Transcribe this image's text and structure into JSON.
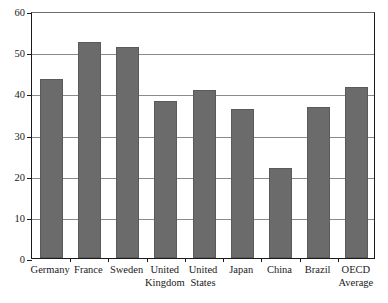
{
  "chart_data": {
    "type": "bar",
    "title": "",
    "subtitle": "",
    "xlabel": "",
    "ylabel": "",
    "categories": [
      "Germany",
      "France",
      "Sweden",
      "United Kingdom",
      "United States",
      "Japan",
      "China",
      "Brazil",
      "OECD Average"
    ],
    "values": [
      43.6,
      52.4,
      51.2,
      38.2,
      40.9,
      36.1,
      21.8,
      36.7,
      41.5
    ],
    "ylim": [
      0,
      60
    ],
    "yticks": [
      0,
      10,
      20,
      30,
      40,
      50,
      60
    ],
    "ytick_labels": [
      "0",
      "10",
      "20",
      "30",
      "40",
      "50",
      "60"
    ],
    "grid": true,
    "legend": false,
    "legend_position": "none",
    "bar_color": "#6b6b6b",
    "axis_color": "#1a1a1a",
    "grid_color": "#8a8a8a",
    "background_color": "#ffffff"
  }
}
